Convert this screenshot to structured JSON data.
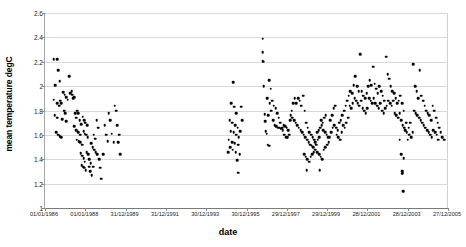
{
  "chart_data": {
    "type": "scatter",
    "title": "",
    "xlabel": "date",
    "ylabel": "mean temperature degC",
    "grid": true,
    "legend": false,
    "marker": "filled-circle-black",
    "marker_color": "#000000",
    "ylim": [
      1,
      2.6
    ],
    "yticks": [
      1,
      1.2,
      1.4,
      1.6,
      1.8,
      2,
      2.2,
      2.4,
      2.6
    ],
    "ytick_labels": [
      "1",
      "1.2",
      "1.4",
      "1.6",
      "1.8",
      "2",
      "2.2",
      "2.4",
      "2.6"
    ],
    "xtick_labels": [
      "01/01/1986",
      "01/01/1988",
      "31/12/1989",
      "31/12/1991",
      "30/12/1993",
      "30/12/1995",
      "29/12/1997",
      "29/12/1999",
      "28/12/2001",
      "28/12/2003",
      "27/12/2005"
    ],
    "xtick_fractions": [
      0.0,
      0.1,
      0.2,
      0.3,
      0.4,
      0.5,
      0.6,
      0.7,
      0.8,
      0.9,
      1.0
    ],
    "xlim_labels": [
      "01/01/1986",
      "27/12/2005"
    ],
    "points": [
      [
        0.022,
        2.22
      ],
      [
        0.03,
        2.22
      ],
      [
        0.026,
        2.01
      ],
      [
        0.022,
        1.89
      ],
      [
        0.033,
        2.13
      ],
      [
        0.036,
        2.04
      ],
      [
        0.038,
        1.88
      ],
      [
        0.04,
        1.86
      ],
      [
        0.045,
        1.95
      ],
      [
        0.049,
        1.93
      ],
      [
        0.052,
        1.91
      ],
      [
        0.056,
        1.89
      ],
      [
        0.06,
        2.08
      ],
      [
        0.062,
        1.94
      ],
      [
        0.068,
        1.93
      ],
      [
        0.072,
        1.91
      ],
      [
        0.031,
        1.86
      ],
      [
        0.035,
        1.84
      ],
      [
        0.047,
        1.8
      ],
      [
        0.05,
        1.78
      ],
      [
        0.024,
        1.76
      ],
      [
        0.03,
        1.74
      ],
      [
        0.043,
        1.73
      ],
      [
        0.053,
        1.71
      ],
      [
        0.028,
        1.62
      ],
      [
        0.033,
        1.6
      ],
      [
        0.036,
        1.59
      ],
      [
        0.04,
        1.58
      ],
      [
        0.066,
        1.96
      ],
      [
        0.07,
        1.9
      ],
      [
        0.075,
        1.78
      ],
      [
        0.078,
        1.74
      ],
      [
        0.08,
        1.8
      ],
      [
        0.082,
        1.78
      ],
      [
        0.086,
        1.72
      ],
      [
        0.09,
        1.69
      ],
      [
        0.073,
        1.67
      ],
      [
        0.077,
        1.64
      ],
      [
        0.083,
        1.62
      ],
      [
        0.087,
        1.6
      ],
      [
        0.079,
        1.56
      ],
      [
        0.084,
        1.55
      ],
      [
        0.088,
        1.54
      ],
      [
        0.092,
        1.52
      ],
      [
        0.094,
        1.75
      ],
      [
        0.097,
        1.72
      ],
      [
        0.1,
        1.7
      ],
      [
        0.104,
        1.68
      ],
      [
        0.096,
        1.63
      ],
      [
        0.099,
        1.61
      ],
      [
        0.102,
        1.6
      ],
      [
        0.106,
        1.58
      ],
      [
        0.089,
        1.45
      ],
      [
        0.093,
        1.43
      ],
      [
        0.096,
        1.41
      ],
      [
        0.099,
        1.38
      ],
      [
        0.103,
        1.46
      ],
      [
        0.107,
        1.44
      ],
      [
        0.11,
        1.4
      ],
      [
        0.113,
        1.37
      ],
      [
        0.091,
        1.35
      ],
      [
        0.095,
        1.34
      ],
      [
        0.098,
        1.33
      ],
      [
        0.101,
        1.31
      ],
      [
        0.109,
        1.34
      ],
      [
        0.112,
        1.3
      ],
      [
        0.116,
        1.27
      ],
      [
        0.119,
        1.34
      ],
      [
        0.115,
        1.53
      ],
      [
        0.118,
        1.5
      ],
      [
        0.122,
        1.48
      ],
      [
        0.126,
        1.46
      ],
      [
        0.128,
        1.72
      ],
      [
        0.132,
        1.66
      ],
      [
        0.121,
        1.6
      ],
      [
        0.124,
        1.57
      ],
      [
        0.13,
        1.44
      ],
      [
        0.134,
        1.4
      ],
      [
        0.137,
        1.33
      ],
      [
        0.14,
        1.24
      ],
      [
        0.148,
        1.68
      ],
      [
        0.152,
        1.6
      ],
      [
        0.156,
        1.55
      ],
      [
        0.145,
        1.44
      ],
      [
        0.158,
        1.78
      ],
      [
        0.162,
        1.72
      ],
      [
        0.166,
        1.61
      ],
      [
        0.17,
        1.54
      ],
      [
        0.173,
        1.84
      ],
      [
        0.176,
        1.8
      ],
      [
        0.179,
        1.68
      ],
      [
        0.182,
        1.54
      ],
      [
        0.184,
        1.6
      ],
      [
        0.186,
        1.44
      ],
      [
        0.467,
        2.03
      ],
      [
        0.462,
        1.86
      ],
      [
        0.47,
        1.83
      ],
      [
        0.474,
        1.78
      ],
      [
        0.458,
        1.72
      ],
      [
        0.465,
        1.7
      ],
      [
        0.472,
        1.68
      ],
      [
        0.478,
        1.66
      ],
      [
        0.461,
        1.63
      ],
      [
        0.468,
        1.62
      ],
      [
        0.475,
        1.6
      ],
      [
        0.481,
        1.58
      ],
      [
        0.456,
        1.56
      ],
      [
        0.464,
        1.54
      ],
      [
        0.471,
        1.53
      ],
      [
        0.479,
        1.52
      ],
      [
        0.459,
        1.5
      ],
      [
        0.466,
        1.48
      ],
      [
        0.473,
        1.46
      ],
      [
        0.483,
        1.44
      ],
      [
        0.455,
        1.46
      ],
      [
        0.484,
        1.63
      ],
      [
        0.487,
        1.83
      ],
      [
        0.49,
        1.72
      ],
      [
        0.477,
        1.39
      ],
      [
        0.48,
        1.29
      ],
      [
        0.54,
        2.39
      ],
      [
        0.54,
        2.28
      ],
      [
        0.54,
        2.21
      ],
      [
        0.541,
        2.2
      ],
      [
        0.543,
        2.0
      ],
      [
        0.545,
        1.77
      ],
      [
        0.547,
        1.71
      ],
      [
        0.556,
        2.05
      ],
      [
        0.56,
        1.98
      ],
      [
        0.552,
        1.9
      ],
      [
        0.564,
        1.88
      ],
      [
        0.558,
        1.86
      ],
      [
        0.568,
        1.84
      ],
      [
        0.572,
        1.82
      ],
      [
        0.562,
        1.8
      ],
      [
        0.576,
        1.78
      ],
      [
        0.554,
        1.76
      ],
      [
        0.58,
        1.74
      ],
      [
        0.566,
        1.72
      ],
      [
        0.584,
        1.7
      ],
      [
        0.57,
        1.68
      ],
      [
        0.588,
        1.66
      ],
      [
        0.574,
        1.67
      ],
      [
        0.592,
        1.68
      ],
      [
        0.578,
        1.66
      ],
      [
        0.596,
        1.67
      ],
      [
        0.582,
        1.66
      ],
      [
        0.586,
        1.65
      ],
      [
        0.6,
        1.66
      ],
      [
        0.59,
        1.64
      ],
      [
        0.604,
        1.64
      ],
      [
        0.548,
        1.63
      ],
      [
        0.55,
        1.61
      ],
      [
        0.594,
        1.6
      ],
      [
        0.598,
        1.58
      ],
      [
        0.553,
        1.52
      ],
      [
        0.557,
        1.51
      ],
      [
        0.608,
        1.72
      ],
      [
        0.612,
        1.8
      ],
      [
        0.616,
        1.86
      ],
      [
        0.62,
        1.9
      ],
      [
        0.624,
        1.86
      ],
      [
        0.628,
        1.9
      ],
      [
        0.632,
        1.88
      ],
      [
        0.636,
        1.84
      ],
      [
        0.61,
        1.76
      ],
      [
        0.614,
        1.74
      ],
      [
        0.618,
        1.72
      ],
      [
        0.622,
        1.7
      ],
      [
        0.626,
        1.68
      ],
      [
        0.63,
        1.66
      ],
      [
        0.634,
        1.64
      ],
      [
        0.638,
        1.62
      ],
      [
        0.606,
        1.6
      ],
      [
        0.602,
        1.58
      ],
      [
        0.64,
        1.92
      ],
      [
        0.644,
        1.8
      ],
      [
        0.648,
        1.7
      ],
      [
        0.652,
        1.66
      ],
      [
        0.642,
        1.6
      ],
      [
        0.646,
        1.58
      ],
      [
        0.65,
        1.56
      ],
      [
        0.654,
        1.54
      ],
      [
        0.656,
        1.62
      ],
      [
        0.66,
        1.6
      ],
      [
        0.664,
        1.58
      ],
      [
        0.668,
        1.56
      ],
      [
        0.658,
        1.52
      ],
      [
        0.662,
        1.51
      ],
      [
        0.666,
        1.5
      ],
      [
        0.67,
        1.54
      ],
      [
        0.643,
        1.44
      ],
      [
        0.647,
        1.42
      ],
      [
        0.651,
        1.4
      ],
      [
        0.655,
        1.38
      ],
      [
        0.659,
        1.42
      ],
      [
        0.663,
        1.44
      ],
      [
        0.667,
        1.46
      ],
      [
        0.671,
        1.48
      ],
      [
        0.649,
        1.31
      ],
      [
        0.673,
        1.52
      ],
      [
        0.677,
        1.56
      ],
      [
        0.681,
        1.58
      ],
      [
        0.675,
        1.62
      ],
      [
        0.679,
        1.64
      ],
      [
        0.683,
        1.66
      ],
      [
        0.687,
        1.68
      ],
      [
        0.685,
        1.72
      ],
      [
        0.689,
        1.7
      ],
      [
        0.693,
        1.74
      ],
      [
        0.697,
        1.76
      ],
      [
        0.691,
        1.64
      ],
      [
        0.695,
        1.62
      ],
      [
        0.699,
        1.6
      ],
      [
        0.703,
        1.58
      ],
      [
        0.676,
        1.46
      ],
      [
        0.68,
        1.44
      ],
      [
        0.684,
        1.42
      ],
      [
        0.688,
        1.4
      ],
      [
        0.692,
        1.48
      ],
      [
        0.696,
        1.5
      ],
      [
        0.7,
        1.52
      ],
      [
        0.704,
        1.54
      ],
      [
        0.682,
        1.31
      ],
      [
        0.706,
        1.58
      ],
      [
        0.71,
        1.62
      ],
      [
        0.714,
        1.66
      ],
      [
        0.708,
        1.72
      ],
      [
        0.712,
        1.76
      ],
      [
        0.716,
        1.82
      ],
      [
        0.72,
        1.84
      ],
      [
        0.718,
        1.68
      ],
      [
        0.722,
        1.66
      ],
      [
        0.726,
        1.64
      ],
      [
        0.73,
        1.7
      ],
      [
        0.724,
        1.6
      ],
      [
        0.728,
        1.58
      ],
      [
        0.732,
        1.56
      ],
      [
        0.736,
        1.62
      ],
      [
        0.734,
        1.72
      ],
      [
        0.738,
        1.76
      ],
      [
        0.742,
        1.8
      ],
      [
        0.746,
        1.84
      ],
      [
        0.74,
        1.68
      ],
      [
        0.744,
        1.66
      ],
      [
        0.748,
        1.7
      ],
      [
        0.752,
        1.74
      ],
      [
        0.75,
        1.88
      ],
      [
        0.754,
        1.92
      ],
      [
        0.758,
        1.96
      ],
      [
        0.762,
        1.94
      ],
      [
        0.756,
        1.84
      ],
      [
        0.76,
        1.82
      ],
      [
        0.764,
        1.86
      ],
      [
        0.768,
        1.9
      ],
      [
        0.766,
        2.01
      ],
      [
        0.77,
        2.08
      ],
      [
        0.774,
        2.0
      ],
      [
        0.778,
        1.96
      ],
      [
        0.772,
        1.88
      ],
      [
        0.776,
        1.86
      ],
      [
        0.78,
        1.84
      ],
      [
        0.784,
        1.88
      ],
      [
        0.782,
        2.26
      ],
      [
        0.786,
        1.96
      ],
      [
        0.79,
        1.92
      ],
      [
        0.794,
        1.9
      ],
      [
        0.788,
        1.82
      ],
      [
        0.792,
        1.8
      ],
      [
        0.796,
        1.78
      ],
      [
        0.8,
        1.82
      ],
      [
        0.798,
        1.94
      ],
      [
        0.802,
        2.0
      ],
      [
        0.806,
        2.05
      ],
      [
        0.81,
        2.01
      ],
      [
        0.804,
        1.9
      ],
      [
        0.808,
        1.88
      ],
      [
        0.812,
        1.86
      ],
      [
        0.816,
        1.9
      ],
      [
        0.814,
        2.16
      ],
      [
        0.818,
        2.02
      ],
      [
        0.822,
        1.98
      ],
      [
        0.826,
        1.94
      ],
      [
        0.82,
        1.86
      ],
      [
        0.824,
        1.84
      ],
      [
        0.828,
        1.82
      ],
      [
        0.832,
        1.86
      ],
      [
        0.83,
        2.0
      ],
      [
        0.834,
        1.96
      ],
      [
        0.838,
        1.92
      ],
      [
        0.842,
        1.88
      ],
      [
        0.836,
        1.8
      ],
      [
        0.84,
        1.78
      ],
      [
        0.844,
        1.82
      ],
      [
        0.848,
        1.84
      ],
      [
        0.846,
        2.24
      ],
      [
        0.85,
        2.1
      ],
      [
        0.854,
        2.06
      ],
      [
        0.858,
        2.0
      ],
      [
        0.852,
        1.88
      ],
      [
        0.856,
        1.86
      ],
      [
        0.86,
        1.84
      ],
      [
        0.864,
        1.88
      ],
      [
        0.862,
        1.96
      ],
      [
        0.866,
        1.94
      ],
      [
        0.87,
        1.9
      ],
      [
        0.874,
        1.86
      ],
      [
        0.868,
        1.78
      ],
      [
        0.872,
        1.76
      ],
      [
        0.876,
        1.74
      ],
      [
        0.88,
        1.78
      ],
      [
        0.878,
        1.88
      ],
      [
        0.882,
        1.92
      ],
      [
        0.886,
        1.86
      ],
      [
        0.89,
        1.8
      ],
      [
        0.884,
        1.72
      ],
      [
        0.888,
        1.68
      ],
      [
        0.892,
        1.66
      ],
      [
        0.896,
        1.7
      ],
      [
        0.894,
        1.64
      ],
      [
        0.898,
        1.62
      ],
      [
        0.902,
        1.66
      ],
      [
        0.906,
        1.7
      ],
      [
        0.9,
        1.56
      ],
      [
        0.904,
        1.6
      ],
      [
        0.908,
        1.58
      ],
      [
        0.912,
        1.62
      ],
      [
        0.88,
        1.56
      ],
      [
        0.884,
        1.44
      ],
      [
        0.89,
        1.41
      ],
      [
        0.886,
        1.3
      ],
      [
        0.888,
        1.29
      ],
      [
        0.887,
        1.28
      ],
      [
        0.889,
        1.14
      ],
      [
        0.914,
        2.18
      ],
      [
        0.918,
        2.0
      ],
      [
        0.922,
        1.96
      ],
      [
        0.926,
        1.9
      ],
      [
        0.916,
        1.8
      ],
      [
        0.92,
        1.78
      ],
      [
        0.924,
        1.76
      ],
      [
        0.928,
        1.74
      ],
      [
        0.93,
        2.13
      ],
      [
        0.934,
        1.92
      ],
      [
        0.938,
        1.88
      ],
      [
        0.942,
        1.84
      ],
      [
        0.932,
        1.72
      ],
      [
        0.936,
        1.7
      ],
      [
        0.94,
        1.68
      ],
      [
        0.944,
        1.66
      ],
      [
        0.946,
        1.8
      ],
      [
        0.95,
        1.78
      ],
      [
        0.954,
        1.76
      ],
      [
        0.958,
        1.72
      ],
      [
        0.948,
        1.64
      ],
      [
        0.952,
        1.62
      ],
      [
        0.956,
        1.6
      ],
      [
        0.96,
        1.58
      ],
      [
        0.962,
        1.84
      ],
      [
        0.966,
        1.8
      ],
      [
        0.97,
        1.74
      ],
      [
        0.974,
        1.7
      ],
      [
        0.964,
        1.64
      ],
      [
        0.968,
        1.62
      ],
      [
        0.972,
        1.6
      ],
      [
        0.976,
        1.56
      ],
      [
        0.978,
        1.66
      ],
      [
        0.982,
        1.62
      ],
      [
        0.986,
        1.58
      ],
      [
        0.99,
        1.56
      ]
    ]
  }
}
